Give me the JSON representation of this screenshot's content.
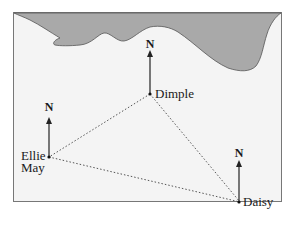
{
  "diagram": {
    "type": "map-bearing-triangle",
    "colors": {
      "land": "#a9a9a9",
      "sea": "#f4f4f4",
      "border": "#777777",
      "lines": "#555555"
    },
    "north_label": "N",
    "points": [
      {
        "id": "dimple",
        "label": "Dimple"
      },
      {
        "id": "ellie-may",
        "label_line1": "Ellie",
        "label_line2": "May"
      },
      {
        "id": "daisy",
        "label": "Daisy"
      }
    ],
    "connections": [
      [
        "dimple",
        "ellie-may"
      ],
      [
        "dimple",
        "daisy"
      ],
      [
        "ellie-may",
        "daisy"
      ]
    ]
  }
}
